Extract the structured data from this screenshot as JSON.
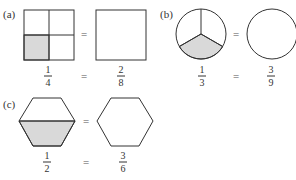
{
  "panels": [
    {
      "label": "(a)",
      "shape": "square",
      "left": {
        "numerator": "1",
        "denominator": "4",
        "parts": 4,
        "shaded": 1
      },
      "right": {
        "numerator": "2",
        "denominator": "8",
        "parts": 8,
        "shaded": 2
      },
      "equals": "="
    },
    {
      "label": "(b)",
      "shape": "circle",
      "left": {
        "numerator": "1",
        "denominator": "3",
        "parts": 3,
        "shaded": 1
      },
      "right": {
        "numerator": "3",
        "denominator": "9",
        "parts": 9,
        "shaded": 3
      },
      "equals": "="
    },
    {
      "label": "(c)",
      "shape": "hexagon",
      "left": {
        "numerator": "1",
        "denominator": "2",
        "parts": 2,
        "shaded": 1
      },
      "right": {
        "numerator": "3",
        "denominator": "6",
        "parts": 6,
        "shaded": 3
      },
      "equals": "="
    }
  ],
  "colors": {
    "shade": "#d9d9d9",
    "stroke": "#333333"
  }
}
